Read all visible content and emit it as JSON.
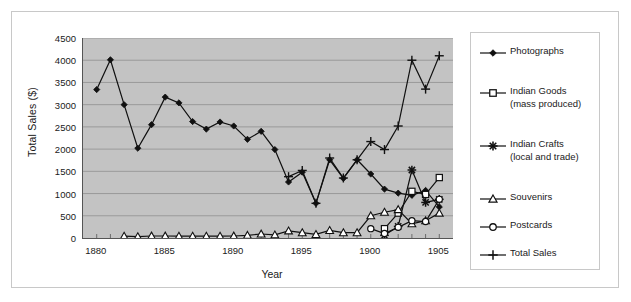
{
  "chart_data": {
    "type": "line",
    "title": "",
    "xlabel": "Year",
    "ylabel": "Total Sales ($)",
    "xlim": [
      1879,
      1906
    ],
    "ylim": [
      0,
      4500
    ],
    "ytick_step": 500,
    "yticks": [
      0,
      500,
      1000,
      1500,
      2000,
      2500,
      3000,
      3500,
      4000,
      4500
    ],
    "ytick_labels": [
      "0",
      "500",
      "1000",
      "1500",
      "2000",
      "2500",
      "3000",
      "3500",
      "4000",
      "4500"
    ],
    "xticks": [
      1880,
      1885,
      1890,
      1895,
      1900,
      1905
    ],
    "xtick_labels": [
      "1880",
      "1885",
      "1890",
      "1895",
      "1900",
      "1905"
    ],
    "grid": "horizontal",
    "plot_background": "#c3c3c3",
    "legend_position": "right",
    "x": [
      1880,
      1881,
      1882,
      1883,
      1884,
      1885,
      1886,
      1887,
      1888,
      1889,
      1890,
      1891,
      1892,
      1893,
      1894,
      1895,
      1896,
      1897,
      1898,
      1899,
      1900,
      1901,
      1902,
      1903,
      1904,
      1905
    ],
    "series": [
      {
        "name": "Photographs",
        "marker": "filled-diamond",
        "values": [
          3340,
          4010,
          3000,
          2020,
          2550,
          3170,
          3040,
          2620,
          2450,
          2610,
          2520,
          2220,
          2400,
          1990,
          1260,
          1480,
          780,
          1760,
          1340,
          1760,
          1440,
          1100,
          1010,
          960,
          1070,
          700
        ]
      },
      {
        "name": "Indian Goods\n(mass produced)",
        "marker": "open-square",
        "values": [
          null,
          null,
          null,
          null,
          null,
          null,
          null,
          null,
          null,
          null,
          null,
          null,
          null,
          null,
          null,
          null,
          null,
          null,
          null,
          null,
          null,
          210,
          560,
          1050,
          980,
          1360
        ]
      },
      {
        "name": "Indian Crafts\n(local and trade)",
        "marker": "asterisk",
        "values": [
          null,
          null,
          null,
          null,
          null,
          null,
          null,
          null,
          null,
          null,
          null,
          null,
          null,
          null,
          null,
          null,
          null,
          null,
          null,
          null,
          null,
          60,
          260,
          1530,
          800,
          870
        ]
      },
      {
        "name": "Souvenirs",
        "marker": "open-triangle",
        "values": [
          null,
          null,
          40,
          30,
          45,
          45,
          40,
          40,
          40,
          40,
          45,
          60,
          90,
          70,
          160,
          120,
          80,
          170,
          120,
          120,
          500,
          580,
          640,
          320,
          390,
          560
        ]
      },
      {
        "name": "Postcards",
        "marker": "open-circle",
        "values": [
          null,
          null,
          null,
          null,
          null,
          null,
          null,
          null,
          null,
          null,
          null,
          null,
          null,
          null,
          null,
          null,
          null,
          null,
          null,
          null,
          210,
          100,
          240,
          390,
          370,
          870
        ]
      },
      {
        "name": "Total Sales",
        "marker": "plus",
        "values": [
          null,
          null,
          null,
          null,
          null,
          null,
          null,
          null,
          null,
          null,
          null,
          null,
          null,
          null,
          1380,
          1520,
          780,
          1800,
          1350,
          1760,
          2170,
          1990,
          2520,
          4000,
          3350,
          4100
        ]
      }
    ]
  },
  "legend": {
    "items": [
      {
        "label": "Photographs",
        "marker": "filled-diamond"
      },
      {
        "label": "Indian Goods\n(mass produced)",
        "marker": "open-square"
      },
      {
        "label": "Indian Crafts\n(local and trade)",
        "marker": "asterisk"
      },
      {
        "label": "Souvenirs",
        "marker": "open-triangle"
      },
      {
        "label": "Postcards",
        "marker": "open-circle"
      },
      {
        "label": "Total Sales",
        "marker": "plus"
      }
    ]
  },
  "colors": {
    "series_line": "#101010",
    "plot_bg": "#c3c3c3",
    "gridline": "#9a9a9a",
    "axis": "#555555",
    "frame": "#c8c8c8",
    "text": "#1a1a1a"
  }
}
